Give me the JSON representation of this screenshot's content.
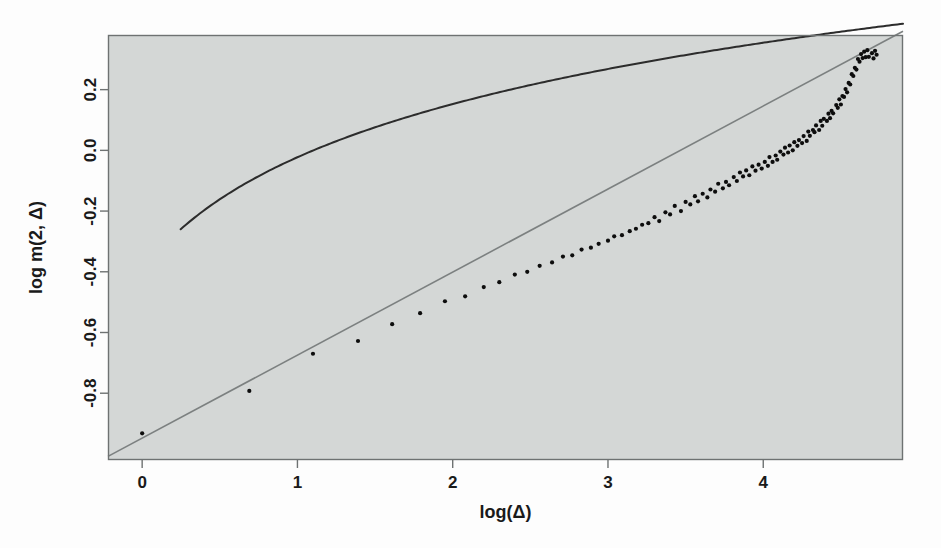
{
  "figure": {
    "panel_background": "#d4d7d6",
    "outer_background": "#fdfdfd",
    "frame_color": "#6e7272",
    "point_color": "#0d0d0d",
    "fit_line_color": "#7c8080",
    "curve_color": "#2c2c2c"
  },
  "chart_data": {
    "type": "scatter",
    "title": "",
    "subtitle": "",
    "xlabel": "log(Δ)",
    "ylabel": "log m(2, Δ)",
    "grid": false,
    "legend": "none",
    "xlim": [
      -0.22,
      4.9
    ],
    "ylim": [
      -1.02,
      0.38
    ],
    "xticks": [
      0,
      1,
      2,
      3,
      4
    ],
    "xtick_labels": [
      "0",
      "1",
      "2",
      "3",
      "4"
    ],
    "yticks": [
      0.2,
      0.0,
      -0.2,
      -0.4,
      -0.6,
      -0.8
    ],
    "ytick_labels": [
      "0.2",
      "0.0",
      "-0.2",
      "-0.4",
      "-0.6",
      "-0.8"
    ],
    "series": [
      {
        "name": "observed",
        "type": "scatter",
        "marker": "filled-circle",
        "marker_size": 4.2,
        "color": "#0d0d0d",
        "points": [
          [
            0.0,
            -0.935
          ],
          [
            0.69,
            -0.79
          ],
          [
            1.1,
            -0.672
          ],
          [
            1.39,
            -0.625
          ],
          [
            1.61,
            -0.575
          ],
          [
            1.79,
            -0.535
          ],
          [
            1.95,
            -0.5
          ],
          [
            2.08,
            -0.478
          ],
          [
            2.2,
            -0.452
          ],
          [
            2.3,
            -0.432
          ],
          [
            2.4,
            -0.412
          ],
          [
            2.48,
            -0.398
          ],
          [
            2.56,
            -0.382
          ],
          [
            2.64,
            -0.366
          ],
          [
            2.71,
            -0.352
          ],
          [
            2.77,
            -0.344
          ],
          [
            2.83,
            -0.33
          ],
          [
            2.89,
            -0.318
          ],
          [
            2.94,
            -0.31
          ],
          [
            3.0,
            -0.296
          ],
          [
            3.04,
            -0.286
          ],
          [
            3.09,
            -0.276
          ],
          [
            3.14,
            -0.268
          ],
          [
            3.18,
            -0.256
          ],
          [
            3.22,
            -0.248
          ],
          [
            3.26,
            -0.238
          ],
          [
            3.3,
            -0.226
          ],
          [
            3.33,
            -0.222
          ],
          [
            3.37,
            -0.214
          ],
          [
            3.4,
            -0.204
          ],
          [
            3.43,
            -0.196
          ],
          [
            3.47,
            -0.188
          ],
          [
            3.5,
            -0.178
          ],
          [
            3.53,
            -0.172
          ],
          [
            3.56,
            -0.162
          ],
          [
            3.58,
            -0.158
          ],
          [
            3.61,
            -0.15
          ],
          [
            3.64,
            -0.142
          ],
          [
            3.66,
            -0.138
          ],
          [
            3.69,
            -0.128
          ],
          [
            3.71,
            -0.122
          ],
          [
            3.74,
            -0.118
          ],
          [
            3.76,
            -0.11
          ],
          [
            3.78,
            -0.104
          ],
          [
            3.81,
            -0.098
          ],
          [
            3.83,
            -0.092
          ],
          [
            3.85,
            -0.086
          ],
          [
            3.87,
            -0.08
          ],
          [
            3.89,
            -0.074
          ],
          [
            3.91,
            -0.07
          ],
          [
            3.93,
            -0.064
          ],
          [
            3.95,
            -0.06
          ],
          [
            3.97,
            -0.056
          ],
          [
            3.99,
            -0.05
          ],
          [
            4.01,
            -0.044
          ],
          [
            4.03,
            -0.038
          ],
          [
            4.04,
            -0.034
          ],
          [
            4.06,
            -0.03
          ],
          [
            4.08,
            -0.024
          ],
          [
            4.09,
            -0.02
          ],
          [
            4.11,
            -0.014
          ],
          [
            4.13,
            -0.008
          ],
          [
            4.14,
            -0.004
          ],
          [
            4.16,
            0.002
          ],
          [
            4.17,
            0.008
          ],
          [
            4.19,
            0.012
          ],
          [
            4.2,
            0.016
          ],
          [
            4.22,
            0.022
          ],
          [
            4.23,
            0.028
          ],
          [
            4.25,
            0.034
          ],
          [
            4.26,
            0.038
          ],
          [
            4.28,
            0.044
          ],
          [
            4.29,
            0.05
          ],
          [
            4.3,
            0.056
          ],
          [
            4.32,
            0.06
          ],
          [
            4.33,
            0.066
          ],
          [
            4.34,
            0.072
          ],
          [
            4.36,
            0.078
          ],
          [
            4.37,
            0.084
          ],
          [
            4.38,
            0.09
          ],
          [
            4.39,
            0.096
          ],
          [
            4.41,
            0.104
          ],
          [
            4.42,
            0.11
          ],
          [
            4.43,
            0.118
          ],
          [
            4.44,
            0.124
          ],
          [
            4.45,
            0.132
          ],
          [
            4.47,
            0.14
          ],
          [
            4.48,
            0.148
          ],
          [
            4.49,
            0.156
          ],
          [
            4.5,
            0.164
          ],
          [
            4.51,
            0.172
          ],
          [
            4.52,
            0.182
          ],
          [
            4.53,
            0.192
          ],
          [
            4.54,
            0.202
          ],
          [
            4.55,
            0.214
          ],
          [
            4.56,
            0.226
          ],
          [
            4.57,
            0.238
          ],
          [
            4.58,
            0.252
          ],
          [
            4.59,
            0.266
          ],
          [
            4.6,
            0.278
          ],
          [
            4.61,
            0.29
          ],
          [
            4.62,
            0.3
          ],
          [
            4.63,
            0.308
          ],
          [
            4.64,
            0.314
          ],
          [
            4.65,
            0.318
          ],
          [
            4.66,
            0.32
          ],
          [
            4.67,
            0.318
          ],
          [
            4.68,
            0.314
          ],
          [
            4.7,
            0.312
          ],
          [
            4.71,
            0.314
          ],
          [
            4.72,
            0.318
          ],
          [
            4.73,
            0.324
          ]
        ],
        "jitter": [
          0.012,
          -0.01,
          0.008,
          -0.012,
          0.01,
          -0.006,
          0.012,
          -0.011,
          0.007,
          -0.009,
          0.011,
          -0.008,
          0.006,
          -0.012,
          0.009,
          -0.007,
          0.013,
          -0.01,
          0.008,
          -0.006,
          0.011,
          -0.013,
          0.007,
          -0.009,
          0.012,
          -0.008,
          0.006,
          -0.011,
          0.01,
          -0.007,
          0.013,
          -0.012,
          0.008,
          -0.006,
          0.011,
          -0.01,
          0.007,
          -0.013,
          0.009,
          -0.008,
          0.012,
          -0.007,
          0.006,
          -0.011,
          0.01,
          -0.009,
          0.013,
          -0.006,
          0.008,
          -0.012,
          0.011,
          -0.007,
          0.009,
          -0.01,
          0.006,
          -0.013,
          0.012,
          -0.008,
          0.007,
          -0.011,
          0.01,
          -0.006,
          0.013,
          -0.009,
          0.008,
          -0.012,
          0.011,
          -0.007,
          0.006,
          -0.01,
          0.009,
          -0.013,
          0.012,
          -0.008,
          0.007,
          -0.006,
          0.01,
          -0.011,
          0.013,
          -0.009,
          0.008,
          -0.007,
          0.011,
          -0.012,
          0.006,
          -0.01,
          0.009,
          -0.008,
          0.012,
          -0.013,
          0.007,
          -0.006,
          0.01,
          -0.011,
          0.008,
          -0.009,
          0.013,
          -0.007,
          0.006,
          -0.012,
          0.011,
          -0.008,
          0.009,
          -0.01,
          0.007,
          -0.013,
          0.012,
          -0.006,
          0.008,
          -0.011,
          0.01,
          -0.009,
          0.013,
          -0.007
        ]
      },
      {
        "name": "linear-fit",
        "type": "line",
        "color": "#7c8080",
        "width": 1.6,
        "kind": "linear",
        "slope": 0.2735,
        "intercept": -0.948,
        "x_from": -0.22,
        "x_to": 4.9
      },
      {
        "name": "model-curve",
        "type": "line",
        "color": "#2c2c2c",
        "width": 2.0,
        "kind": "log-saturating",
        "amplitude": 0.345,
        "scale": 0.76,
        "offset": -0.26,
        "x_from": 0.248,
        "x_to": 4.9
      }
    ]
  },
  "axes": {
    "x_axis_name": "x-axis",
    "y_axis_name": "y-axis"
  }
}
